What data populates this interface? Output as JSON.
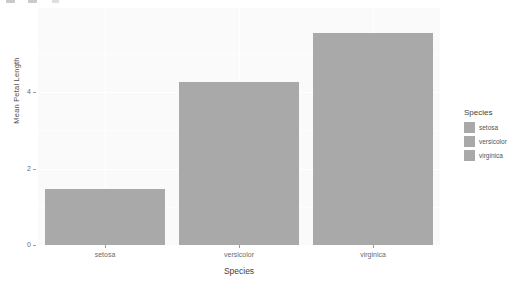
{
  "toolbar": {
    "glyphs": [
      "toolbar-glyph-1",
      "toolbar-glyph-2",
      "toolbar-glyph-3"
    ]
  },
  "chart_data": {
    "type": "bar",
    "title": "",
    "subtitle": "",
    "categories": [
      "setosa",
      "versicolor",
      "virginica"
    ],
    "values": [
      1.46,
      4.26,
      5.55
    ],
    "xlabel": "Species",
    "ylabel": "Mean Petal Length",
    "ylim": [
      0,
      6.2
    ],
    "yticks": [
      0,
      2,
      4
    ],
    "ytick_labels": [
      "0",
      "2",
      "4"
    ],
    "xtick_labels": [
      "setosa",
      "versicolor",
      "virginica"
    ],
    "grid": true,
    "grid_color": "#ffffff",
    "panel_background": "#fafafa",
    "bar_color": "#a9a9a9",
    "legend": {
      "position": "right",
      "title": "Species",
      "entries": [
        {
          "label": "setosa",
          "color": "#a9a9a9"
        },
        {
          "label": "versicolor",
          "color": "#a9a9a9"
        },
        {
          "label": "virginica",
          "color": "#a9a9a9"
        }
      ]
    }
  }
}
